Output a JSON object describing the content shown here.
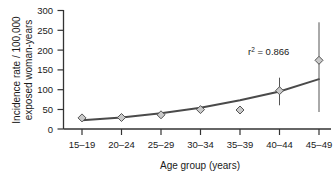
{
  "chart_data": {
    "type": "scatter",
    "title": "",
    "subtitle": "",
    "xlabel": "Age group (years)",
    "ylabel": "Incidence rate / 100,000 exposed woman-years",
    "ylabel_line1": "Incidence rate / 100,000",
    "ylabel_line2": "exposed woman-years",
    "categories": [
      "15–19",
      "20–24",
      "25–29",
      "30–34",
      "35–39",
      "40–44",
      "45–49"
    ],
    "values": [
      28,
      29,
      36,
      49,
      48,
      97,
      174
    ],
    "error_low": [
      28,
      29,
      36,
      44,
      38,
      60,
      43
    ],
    "error_high": [
      28,
      29,
      36,
      55,
      58,
      130,
      270
    ],
    "fit_curve": {
      "name": "Fitted exponential trend",
      "x": [
        "15–19",
        "20–24",
        "25–29",
        "30–34",
        "35–39",
        "40–44",
        "45–49"
      ],
      "values": [
        22,
        29,
        40,
        54,
        73,
        95,
        126
      ]
    },
    "ylim": [
      0,
      300
    ],
    "yticks": [
      0,
      50,
      100,
      150,
      200,
      250,
      300
    ],
    "ytick_labels": [
      "0",
      "50",
      "100",
      "150",
      "200",
      "250",
      "300"
    ],
    "grid": false,
    "legend": "none",
    "annotations": [
      {
        "id": "r-squared",
        "text_prefix": "r",
        "text_superscript": "2",
        "text_suffix": " = 0.866",
        "full_text": "r² = 0.866"
      }
    ],
    "colors": {
      "curve": "#4a4a4a",
      "marker_fill": "#c9c9c9",
      "marker_edge": "#555555",
      "error_bar": "#555555",
      "axis": "#333333",
      "text": "#1a1a1a",
      "background": "#ffffff"
    }
  }
}
